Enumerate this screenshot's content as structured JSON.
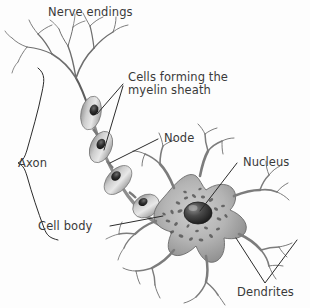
{
  "figure": {
    "background_color": "#fdfdfd",
    "text_color": "#3a3a3a",
    "line_color": "#2b2b2b"
  },
  "labels": {
    "nerve_endings": "Nerve endings",
    "myelin_line1": "Cells forming the",
    "myelin_line2": "myelin sheath",
    "node": "Node",
    "nucleus": "Nucleus",
    "axon": "Axon",
    "cell_body": "Cell body",
    "dendrites": "Dendrites"
  },
  "structures": [
    {
      "name": "nerve-endings",
      "label": "Nerve endings",
      "connector": "none"
    },
    {
      "name": "myelin-sheath-cells",
      "label": "Cells forming the myelin sheath",
      "connector": "two-leader-lines"
    },
    {
      "name": "node-of-ranvier",
      "label": "Node",
      "connector": "leader-line"
    },
    {
      "name": "nucleus",
      "label": "Nucleus",
      "connector": "leader-line"
    },
    {
      "name": "axon",
      "label": "Axon",
      "connector": "curly-brace"
    },
    {
      "name": "cell-body",
      "label": "Cell body",
      "connector": "leader-line"
    },
    {
      "name": "dendrites",
      "label": "Dendrites",
      "connector": "v-bracket"
    }
  ]
}
